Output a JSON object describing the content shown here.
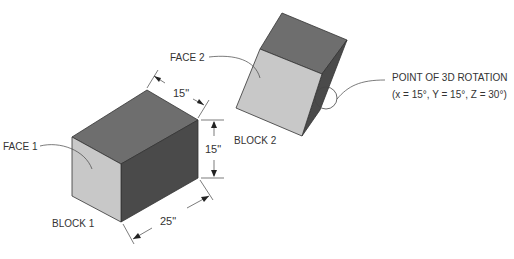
{
  "labels": {
    "face1": "FACE 1",
    "face2": "FACE 2",
    "block1": "BLOCK 1",
    "block2": "BLOCK 2",
    "rotation_line1": "POINT OF 3D ROTATION",
    "rotation_line2": "(x = 15°, Y = 15°, Z = 30°)"
  },
  "dimensions": {
    "depth": "15\"",
    "height": "15\"",
    "length": "25\""
  },
  "colors": {
    "top_face": "#6e6e6e",
    "side_face": "#4a4a4a",
    "front_face": "#c8c8c8",
    "line": "#333333"
  }
}
